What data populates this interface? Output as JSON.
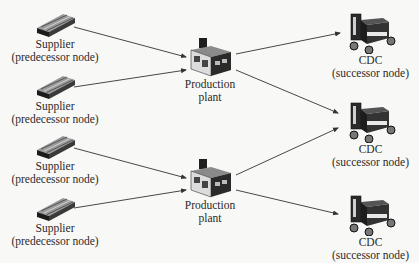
{
  "diagram": {
    "type": "supply-chain-network",
    "colors": {
      "background": "#f8f8f6",
      "edge": "#333333",
      "icon_dark": "#1e1e1e",
      "icon_mid": "#6a6a6a",
      "icon_light": "#bdbdbd"
    },
    "suppliers": [
      {
        "id": "s1",
        "title": "Supplier",
        "subtitle": "(predecessor node)"
      },
      {
        "id": "s2",
        "title": "Supplier",
        "subtitle": "(predecessor node)"
      },
      {
        "id": "s3",
        "title": "Supplier",
        "subtitle": "(predecessor node)"
      },
      {
        "id": "s4",
        "title": "Supplier",
        "subtitle": "(predecessor node)"
      }
    ],
    "plants": [
      {
        "id": "p1",
        "title": "Production",
        "subtitle": "plant"
      },
      {
        "id": "p2",
        "title": "Production",
        "subtitle": "plant"
      }
    ],
    "cdcs": [
      {
        "id": "c1",
        "title": "CDC",
        "subtitle": "(successor node)"
      },
      {
        "id": "c2",
        "title": "CDC",
        "subtitle": "(successor node)"
      },
      {
        "id": "c3",
        "title": "CDC",
        "subtitle": "(successor node)"
      }
    ],
    "edges": [
      {
        "from": "s1",
        "to": "p1"
      },
      {
        "from": "s2",
        "to": "p1"
      },
      {
        "from": "s3",
        "to": "p2"
      },
      {
        "from": "s4",
        "to": "p2"
      },
      {
        "from": "p1",
        "to": "c1"
      },
      {
        "from": "p1",
        "to": "c2"
      },
      {
        "from": "p2",
        "to": "c2"
      },
      {
        "from": "p2",
        "to": "c3"
      }
    ]
  }
}
